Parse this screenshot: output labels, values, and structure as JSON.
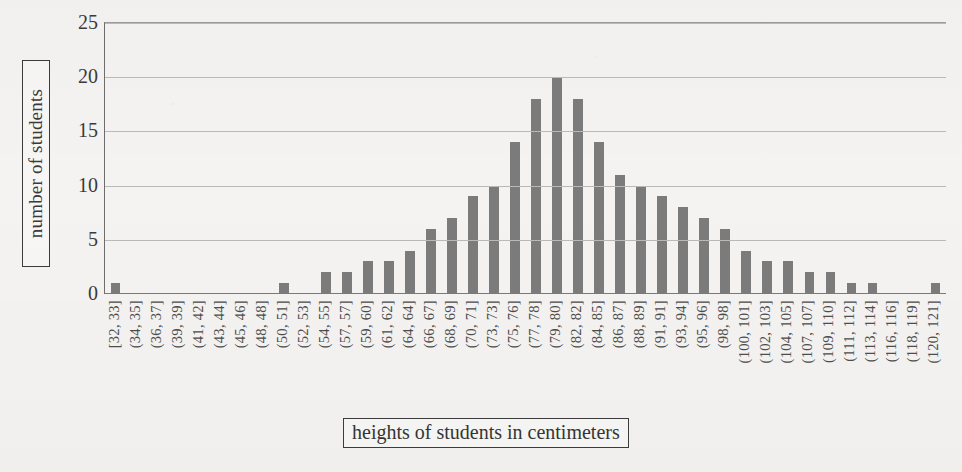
{
  "chart_data": {
    "type": "bar",
    "title": "",
    "subtitle": "",
    "xlabel": "heights of students in centimeters",
    "ylabel": "number of students",
    "ylim": [
      0,
      25
    ],
    "yticks": [
      0,
      5,
      10,
      15,
      20,
      25
    ],
    "grid": true,
    "legend": false,
    "legend_position": "none",
    "bar_color": "#7b7b7b",
    "categories": [
      "[32, 33]",
      "(34, 35]",
      "(36, 37]",
      "(39, 39]",
      "(41, 42]",
      "(43, 44]",
      "(45, 46]",
      "(48, 48]",
      "(50, 51]",
      "(52, 53]",
      "(54, 55]",
      "(57, 57]",
      "(59, 60]",
      "(61, 62]",
      "(64, 64]",
      "(66, 67]",
      "(68, 69]",
      "(70, 71]",
      "(73, 73]",
      "(75, 76]",
      "(77, 78]",
      "(79, 80]",
      "(82, 82]",
      "(84, 85]",
      "(86, 87]",
      "(88, 89]",
      "(91, 91]",
      "(93, 94]",
      "(95, 96]",
      "(98, 98]",
      "(100, 101]",
      "(102, 103]",
      "(104, 105]",
      "(107, 107]",
      "(109, 110]",
      "(111, 112]",
      "(113, 114]",
      "(116, 116]",
      "(118, 119]",
      "(120, 121]"
    ],
    "values": [
      1,
      0,
      0,
      0,
      0,
      0,
      0,
      0,
      1,
      0,
      2,
      2,
      3,
      3,
      4,
      6,
      7,
      9,
      10,
      14,
      18,
      20,
      18,
      14,
      11,
      10,
      9,
      8,
      7,
      6,
      4,
      3,
      3,
      2,
      2,
      1,
      1,
      0,
      0,
      1
    ]
  },
  "axes": {
    "y_title": "number of students",
    "x_title": "heights of students in centimeters"
  }
}
